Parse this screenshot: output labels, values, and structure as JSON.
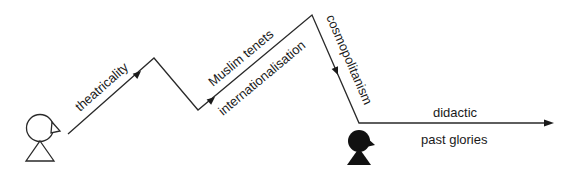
{
  "diagram": {
    "labels": {
      "segment1": "theatricality",
      "segment3_above": "Muslim tenets",
      "segment3_below": "internationalisation",
      "segment4": "cosmopolitanism",
      "segment5_above": "didactic",
      "segment5_below": "past glories"
    },
    "figures": {
      "start": "open-figure",
      "end": "filled-figure"
    },
    "colors": {
      "line": "#2a2a2a",
      "text": "#1a1a1a",
      "background": "#ffffff"
    }
  }
}
